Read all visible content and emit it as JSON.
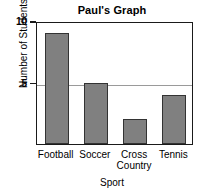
{
  "chart_data": {
    "type": "bar",
    "title": "Paul's Graph",
    "xlabel": "Sport",
    "ylabel": "Number of Students",
    "categories": [
      "Football",
      "Soccer",
      "Cross\nCountry",
      "Tennis"
    ],
    "values": [
      9,
      5,
      2,
      4
    ],
    "ylim": [
      0,
      10
    ],
    "yticks": [
      5,
      10
    ],
    "ytick_labels": [
      "5",
      "10"
    ],
    "gridlines": [
      5
    ],
    "grid": true,
    "legend": "none",
    "bar_color": "#808080",
    "bar_edge_color": "#333333",
    "axis_color": "#1a1a1a",
    "gridline_color": "#9a9a9a",
    "background": "#ffffff"
  }
}
